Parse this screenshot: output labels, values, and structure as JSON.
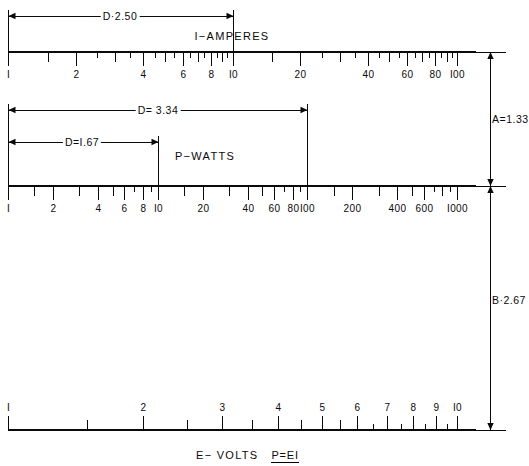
{
  "figure": {
    "caption_axis": "E− VOLTS",
    "caption_formula": "P=EI"
  },
  "geometry": {
    "left_x": 8,
    "right_x": 457,
    "axis_amperes_y": 52,
    "axis_watts_y": 186,
    "axis_volts_y": 430,
    "vert_rule_x": 490,
    "tick_major": 14,
    "tick_mid": 10,
    "tick_minor": 6
  },
  "colors": {
    "ink": "#0a0a0a",
    "paper": "#ffffff"
  },
  "scales": [
    {
      "id": "amperes",
      "name": "I−AMPERES",
      "name_x": 232,
      "name_y": 36,
      "decades": 2,
      "min": 1,
      "max": 100,
      "tick_side": "down",
      "label_side": "below",
      "ticks": [
        {
          "value": 1,
          "label": "I",
          "size": "major"
        },
        {
          "value": 1.5,
          "label": "",
          "size": "mid"
        },
        {
          "value": 2,
          "label": "2",
          "size": "major"
        },
        {
          "value": 2.5,
          "label": "",
          "size": "minor"
        },
        {
          "value": 3,
          "label": "",
          "size": "mid"
        },
        {
          "value": 3.5,
          "label": "",
          "size": "minor"
        },
        {
          "value": 4,
          "label": "4",
          "size": "major"
        },
        {
          "value": 4.5,
          "label": "",
          "size": "minor"
        },
        {
          "value": 5,
          "label": "",
          "size": "mid"
        },
        {
          "value": 5.5,
          "label": "",
          "size": "minor"
        },
        {
          "value": 6,
          "label": "6",
          "size": "major"
        },
        {
          "value": 6.5,
          "label": "",
          "size": "minor"
        },
        {
          "value": 7,
          "label": "",
          "size": "mid"
        },
        {
          "value": 7.5,
          "label": "",
          "size": "minor"
        },
        {
          "value": 8,
          "label": "8",
          "size": "major"
        },
        {
          "value": 8.5,
          "label": "",
          "size": "minor"
        },
        {
          "value": 9,
          "label": "",
          "size": "mid"
        },
        {
          "value": 9.5,
          "label": "",
          "size": "minor"
        },
        {
          "value": 10,
          "label": "I0",
          "size": "major"
        },
        {
          "value": 15,
          "label": "",
          "size": "mid"
        },
        {
          "value": 20,
          "label": "20",
          "size": "major"
        },
        {
          "value": 25,
          "label": "",
          "size": "minor"
        },
        {
          "value": 30,
          "label": "",
          "size": "mid"
        },
        {
          "value": 35,
          "label": "",
          "size": "minor"
        },
        {
          "value": 40,
          "label": "40",
          "size": "major"
        },
        {
          "value": 45,
          "label": "",
          "size": "minor"
        },
        {
          "value": 50,
          "label": "",
          "size": "mid"
        },
        {
          "value": 55,
          "label": "",
          "size": "minor"
        },
        {
          "value": 60,
          "label": "60",
          "size": "major"
        },
        {
          "value": 65,
          "label": "",
          "size": "minor"
        },
        {
          "value": 70,
          "label": "",
          "size": "mid"
        },
        {
          "value": 75,
          "label": "",
          "size": "minor"
        },
        {
          "value": 80,
          "label": "80",
          "size": "major"
        },
        {
          "value": 85,
          "label": "",
          "size": "minor"
        },
        {
          "value": 90,
          "label": "",
          "size": "mid"
        },
        {
          "value": 95,
          "label": "",
          "size": "minor"
        },
        {
          "value": 100,
          "label": "I00",
          "size": "major"
        }
      ]
    },
    {
      "id": "watts",
      "name": "P−WATTS",
      "name_x": 205,
      "name_y": 156,
      "decades": 3,
      "min": 1,
      "max": 1000,
      "tick_side": "down",
      "label_side": "below",
      "ticks": [
        {
          "value": 1,
          "label": "I",
          "size": "major"
        },
        {
          "value": 1.5,
          "label": "",
          "size": "mid"
        },
        {
          "value": 2,
          "label": "2",
          "size": "major"
        },
        {
          "value": 3,
          "label": "",
          "size": "mid"
        },
        {
          "value": 4,
          "label": "4",
          "size": "major"
        },
        {
          "value": 5,
          "label": "",
          "size": "mid"
        },
        {
          "value": 6,
          "label": "6",
          "size": "major"
        },
        {
          "value": 7,
          "label": "",
          "size": "minor"
        },
        {
          "value": 8,
          "label": "8",
          "size": "major"
        },
        {
          "value": 9,
          "label": "",
          "size": "minor"
        },
        {
          "value": 10,
          "label": "I0",
          "size": "major"
        },
        {
          "value": 15,
          "label": "",
          "size": "mid"
        },
        {
          "value": 20,
          "label": "20",
          "size": "major"
        },
        {
          "value": 30,
          "label": "",
          "size": "mid"
        },
        {
          "value": 40,
          "label": "40",
          "size": "major"
        },
        {
          "value": 50,
          "label": "",
          "size": "mid"
        },
        {
          "value": 60,
          "label": "60",
          "size": "major"
        },
        {
          "value": 70,
          "label": "",
          "size": "minor"
        },
        {
          "value": 80,
          "label": "80",
          "size": "major"
        },
        {
          "value": 90,
          "label": "",
          "size": "minor"
        },
        {
          "value": 100,
          "label": "I00",
          "size": "major"
        },
        {
          "value": 150,
          "label": "",
          "size": "mid"
        },
        {
          "value": 200,
          "label": "200",
          "size": "major"
        },
        {
          "value": 300,
          "label": "",
          "size": "mid"
        },
        {
          "value": 400,
          "label": "400",
          "size": "major"
        },
        {
          "value": 500,
          "label": "",
          "size": "mid"
        },
        {
          "value": 600,
          "label": "600",
          "size": "major"
        },
        {
          "value": 700,
          "label": "",
          "size": "minor"
        },
        {
          "value": 800,
          "label": "",
          "size": "mid"
        },
        {
          "value": 900,
          "label": "",
          "size": "minor"
        },
        {
          "value": 1000,
          "label": "I000",
          "size": "major"
        }
      ]
    },
    {
      "id": "volts",
      "name": "",
      "decades": 1,
      "min": 1,
      "max": 10,
      "tick_side": "up",
      "label_side": "above",
      "ticks": [
        {
          "value": 1,
          "label": "I",
          "size": "major"
        },
        {
          "value": 1.5,
          "label": "",
          "size": "mid"
        },
        {
          "value": 2,
          "label": "2",
          "size": "major"
        },
        {
          "value": 2.5,
          "label": "",
          "size": "mid"
        },
        {
          "value": 3,
          "label": "3",
          "size": "major"
        },
        {
          "value": 3.5,
          "label": "",
          "size": "mid"
        },
        {
          "value": 4,
          "label": "4",
          "size": "major"
        },
        {
          "value": 4.5,
          "label": "",
          "size": "mid"
        },
        {
          "value": 5,
          "label": "5",
          "size": "major"
        },
        {
          "value": 5.5,
          "label": "",
          "size": "mid"
        },
        {
          "value": 6,
          "label": "6",
          "size": "major"
        },
        {
          "value": 6.5,
          "label": "",
          "size": "minor"
        },
        {
          "value": 7,
          "label": "7",
          "size": "major"
        },
        {
          "value": 7.5,
          "label": "",
          "size": "minor"
        },
        {
          "value": 8,
          "label": "8",
          "size": "major"
        },
        {
          "value": 8.5,
          "label": "",
          "size": "minor"
        },
        {
          "value": 9,
          "label": "9",
          "size": "major"
        },
        {
          "value": 9.5,
          "label": "",
          "size": "minor"
        },
        {
          "value": 10,
          "label": "I0",
          "size": "major"
        }
      ]
    }
  ],
  "dimensions_horizontal": [
    {
      "id": "d-250",
      "label": "D·2.50",
      "scale": "amperes",
      "from_value": 1,
      "to_value": 10,
      "line_y": 16,
      "ext_top": 16,
      "ext_bottom": 52,
      "label_x": 120,
      "label_y": 16
    },
    {
      "id": "d-334",
      "label": "D= 3.34",
      "scale": "watts",
      "from_value": 1,
      "to_value": 100,
      "line_y": 110,
      "ext_top": 110,
      "ext_bottom": 186,
      "label_x": 158,
      "label_y": 110
    },
    {
      "id": "d-167",
      "label": "D=I.67",
      "scale": "watts",
      "from_value": 1,
      "to_value": 10,
      "line_y": 142,
      "ext_top": 142,
      "ext_bottom": 186,
      "label_x": 82,
      "label_y": 142
    }
  ],
  "dimensions_vertical": [
    {
      "id": "a-133",
      "label": "A=1.33",
      "from_y": 52,
      "to_y": 186,
      "label_x": 492,
      "label_y": 119
    },
    {
      "id": "b-267",
      "label": "B·2.67",
      "from_y": 186,
      "to_y": 430,
      "label_x": 492,
      "label_y": 300
    }
  ],
  "caption": {
    "axis_label": "E− VOLTS",
    "formula": "P=EI",
    "x": 196,
    "y": 449
  }
}
